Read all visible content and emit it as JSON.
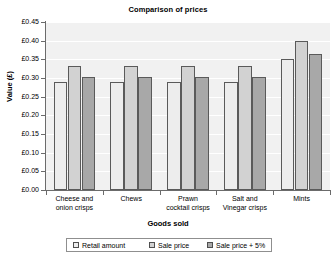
{
  "chart_data": {
    "type": "bar",
    "title": "Comparison of prices",
    "xlabel": "Goods sold",
    "ylabel": "Value (£)",
    "categories": [
      "Cheese and onion crisps",
      "Chews",
      "Prawn cocktail crisps",
      "Salt and Vinegar crisps",
      "Mints"
    ],
    "series": [
      {
        "name": "Retail amount",
        "values": [
          0.289,
          0.289,
          0.289,
          0.289,
          0.35
        ],
        "color": "#ededed"
      },
      {
        "name": "Sale price",
        "values": [
          0.332,
          0.332,
          0.332,
          0.332,
          0.399
        ],
        "color": "#d2d2d2"
      },
      {
        "name": "Sale price + 5%",
        "values": [
          0.302,
          0.302,
          0.302,
          0.302,
          0.365
        ],
        "color": "#a8a8a8"
      }
    ],
    "ylim": [
      0.0,
      0.45
    ],
    "ytick_labels": [
      "£0.00",
      "£0.05",
      "£0.10",
      "£0.15",
      "£0.20",
      "£0.25",
      "£0.30",
      "£0.35",
      "£0.40",
      "£0.45"
    ],
    "ytick_values": [
      0.0,
      0.05,
      0.1,
      0.15,
      0.2,
      0.25,
      0.3,
      0.35,
      0.4,
      0.45
    ],
    "grid": true,
    "legend_position": "bottom",
    "plot_background": "#f1f1f1",
    "gridline_color": "#ffffff",
    "axis_color": "#6b6b6b"
  },
  "category_label_lines": [
    [
      "Cheese and",
      "onion crisps"
    ],
    [
      "Chews",
      ""
    ],
    [
      "Prawn",
      "cocktail crisps"
    ],
    [
      "Salt and",
      "Vinegar crisps"
    ],
    [
      "Mints",
      ""
    ]
  ]
}
